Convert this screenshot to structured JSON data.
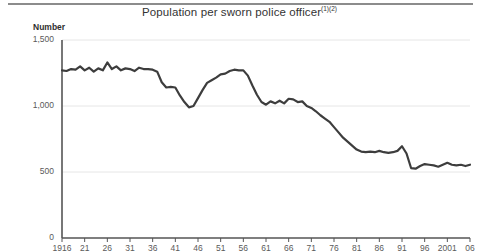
{
  "figure": {
    "title_text": "Population per sworn police officer",
    "title_superscript": "(1)(2)",
    "unit_label": "Number"
  },
  "colors": {
    "line": "#3d3d3d",
    "axis": "#555555",
    "grid": "#e6e6e6",
    "rule": "#8c8c8c",
    "text": "#5a5a5a"
  },
  "chart_data": {
    "type": "line",
    "title": "Population per sworn police officer(1)(2)",
    "xlabel": "",
    "ylabel": "Number",
    "ylim": [
      0,
      1500
    ],
    "yticks": [
      0,
      500,
      1000,
      1500
    ],
    "ytick_labels": [
      "0",
      "500",
      "1,000",
      "1,500"
    ],
    "grid": true,
    "legend": false,
    "xlim": [
      1916,
      2006
    ],
    "xticks": [
      1916,
      1921,
      1926,
      1931,
      1936,
      1941,
      1946,
      1951,
      1956,
      1961,
      1966,
      1971,
      1976,
      1981,
      1986,
      1991,
      1996,
      2001,
      2006
    ],
    "xtick_labels": [
      "1916",
      "21",
      "26",
      "31",
      "36",
      "41",
      "46",
      "51",
      "56",
      "61",
      "66",
      "71",
      "76",
      "81",
      "86",
      "91",
      "96",
      "2001",
      "06"
    ],
    "series": [
      {
        "name": "Population per sworn police officer",
        "x": [
          1916,
          1917,
          1918,
          1919,
          1920,
          1921,
          1922,
          1923,
          1924,
          1925,
          1926,
          1927,
          1928,
          1929,
          1930,
          1931,
          1932,
          1933,
          1934,
          1935,
          1936,
          1937,
          1938,
          1939,
          1940,
          1941,
          1942,
          1943,
          1944,
          1945,
          1946,
          1947,
          1948,
          1949,
          1950,
          1951,
          1952,
          1953,
          1954,
          1955,
          1956,
          1957,
          1958,
          1959,
          1960,
          1961,
          1962,
          1963,
          1964,
          1965,
          1966,
          1967,
          1968,
          1969,
          1970,
          1971,
          1972,
          1973,
          1974,
          1975,
          1976,
          1977,
          1978,
          1979,
          1980,
          1981,
          1982,
          1983,
          1984,
          1985,
          1986,
          1987,
          1988,
          1989,
          1990,
          1991,
          1992,
          1993,
          1994,
          1995,
          1996,
          1997,
          1998,
          1999,
          2000,
          2001,
          2002,
          2003,
          2004,
          2005,
          2006
        ],
        "y": [
          1270,
          1265,
          1280,
          1275,
          1300,
          1270,
          1290,
          1260,
          1285,
          1270,
          1330,
          1280,
          1300,
          1270,
          1285,
          1280,
          1265,
          1290,
          1280,
          1280,
          1275,
          1260,
          1180,
          1140,
          1145,
          1140,
          1080,
          1030,
          990,
          1000,
          1060,
          1120,
          1175,
          1195,
          1215,
          1240,
          1245,
          1265,
          1275,
          1270,
          1270,
          1230,
          1155,
          1085,
          1030,
          1010,
          1035,
          1020,
          1040,
          1020,
          1055,
          1050,
          1030,
          1035,
          1000,
          985,
          960,
          930,
          905,
          880,
          840,
          800,
          760,
          730,
          700,
          670,
          655,
          650,
          655,
          650,
          660,
          650,
          645,
          650,
          660,
          695,
          640,
          530,
          525,
          545,
          560,
          555,
          550,
          540,
          555,
          570,
          555,
          550,
          555,
          545,
          555
        ]
      }
    ]
  },
  "plot_geometry": {
    "left_px": 62,
    "right_px": 470,
    "top_px": 40,
    "bottom_px": 238
  }
}
